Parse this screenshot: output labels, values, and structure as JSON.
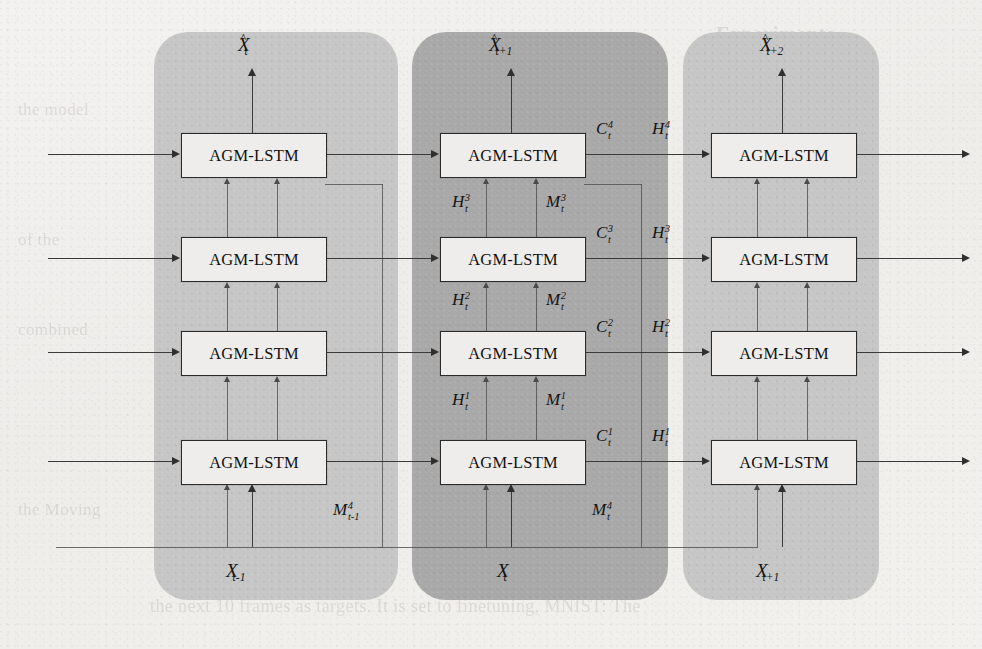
{
  "figure": {
    "kind": "neural-network-architecture-diagram",
    "cell_label": "AGM-LSTM",
    "layers": 4,
    "timesteps": 3,
    "colors": {
      "panel_light": "#c6c6c6",
      "panel_dark": "#a9a9a9",
      "cell_fill": "#eeedeb",
      "cell_border": "#2a2a2a",
      "wire": "#3a3a3a",
      "paper": "#f2f0ee"
    }
  },
  "timesteps": [
    {
      "id": "t-minus-1",
      "shade": "light",
      "input": {
        "base": "X",
        "sub": "t-1",
        "sup": ""
      },
      "output": {
        "hat": true,
        "base": "X",
        "sub": "t",
        "sup": ""
      },
      "memory_route": {
        "base": "M",
        "sub": "t-1",
        "sup": "4"
      },
      "cells": [
        {
          "layer": 1,
          "label": "AGM-LSTM"
        },
        {
          "layer": 2,
          "label": "AGM-LSTM"
        },
        {
          "layer": 3,
          "label": "AGM-LSTM"
        },
        {
          "layer": 4,
          "label": "AGM-LSTM"
        }
      ]
    },
    {
      "id": "t",
      "shade": "dark",
      "input": {
        "base": "X",
        "sub": "t",
        "sup": ""
      },
      "output": {
        "hat": true,
        "base": "X",
        "sub": "t+1",
        "sup": ""
      },
      "memory_route": {
        "base": "M",
        "sub": "t",
        "sup": "4"
      },
      "cells": [
        {
          "layer": 1,
          "label": "AGM-LSTM"
        },
        {
          "layer": 2,
          "label": "AGM-LSTM"
        },
        {
          "layer": 3,
          "label": "AGM-LSTM"
        },
        {
          "layer": 4,
          "label": "AGM-LSTM"
        }
      ],
      "vertical_links": [
        {
          "between_layers": "1->2",
          "hidden": {
            "base": "H",
            "sub": "t",
            "sup": "1"
          },
          "memory": {
            "base": "M",
            "sub": "t",
            "sup": "1"
          }
        },
        {
          "between_layers": "2->3",
          "hidden": {
            "base": "H",
            "sub": "t",
            "sup": "2"
          },
          "memory": {
            "base": "M",
            "sub": "t",
            "sup": "2"
          }
        },
        {
          "between_layers": "3->4",
          "hidden": {
            "base": "H",
            "sub": "t",
            "sup": "3"
          },
          "memory": {
            "base": "M",
            "sub": "t",
            "sup": "3"
          }
        }
      ]
    },
    {
      "id": "t-plus-1",
      "shade": "light",
      "input": {
        "base": "X",
        "sub": "t+1",
        "sup": ""
      },
      "output": {
        "hat": true,
        "base": "X",
        "sub": "t+2",
        "sup": ""
      },
      "memory_route": null,
      "cells": [
        {
          "layer": 1,
          "label": "AGM-LSTM"
        },
        {
          "layer": 2,
          "label": "AGM-LSTM"
        },
        {
          "layer": 3,
          "label": "AGM-LSTM"
        },
        {
          "layer": 4,
          "label": "AGM-LSTM"
        }
      ]
    }
  ],
  "state_flow_labels": [
    {
      "layer": 4,
      "cell": {
        "base": "C",
        "sub": "t",
        "sup": "4"
      },
      "hidden": {
        "base": "H",
        "sub": "t",
        "sup": "4"
      }
    },
    {
      "layer": 3,
      "cell": {
        "base": "C",
        "sub": "t",
        "sup": "3"
      },
      "hidden": {
        "base": "H",
        "sub": "t",
        "sup": "3"
      }
    },
    {
      "layer": 2,
      "cell": {
        "base": "C",
        "sub": "t",
        "sup": "2"
      },
      "hidden": {
        "base": "H",
        "sub": "t",
        "sup": "2"
      }
    },
    {
      "layer": 1,
      "cell": {
        "base": "C",
        "sub": "t",
        "sup": "1"
      },
      "hidden": {
        "base": "H",
        "sub": "t",
        "sup": "1"
      }
    }
  ],
  "background_bleed_text": [
    "Experiments",
    "the model",
    "in the",
    "sequence",
    "of the",
    "test. The model",
    "combined",
    "Moving",
    "dataset",
    "the Moving",
    "We use",
    "of the next",
    "the next 10 frames as targets. It is set to finetuning, MNIST: The"
  ]
}
